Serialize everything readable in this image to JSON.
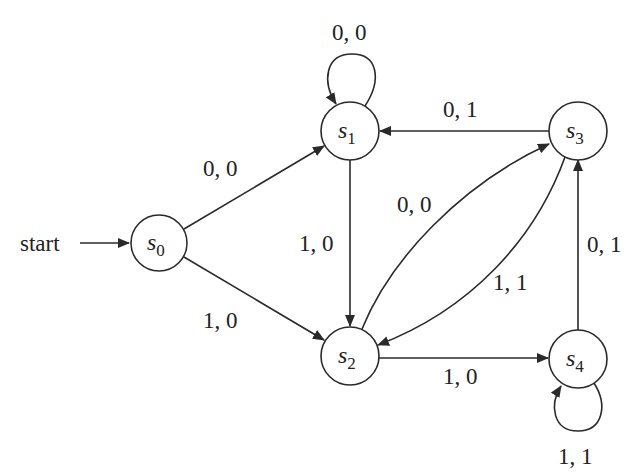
{
  "diagram": {
    "type": "finite-state-machine",
    "start_label": "start",
    "states": [
      {
        "id": "s0",
        "name": "s",
        "sub": "0"
      },
      {
        "id": "s1",
        "name": "s",
        "sub": "1"
      },
      {
        "id": "s2",
        "name": "s",
        "sub": "2"
      },
      {
        "id": "s3",
        "name": "s",
        "sub": "3"
      },
      {
        "id": "s4",
        "name": "s",
        "sub": "4"
      }
    ],
    "transitions": [
      {
        "from": "s0",
        "to": "s1",
        "label": "0, 0"
      },
      {
        "from": "s0",
        "to": "s2",
        "label": "1, 0"
      },
      {
        "from": "s1",
        "to": "s1",
        "label": "0, 0"
      },
      {
        "from": "s1",
        "to": "s2",
        "label": "1, 0"
      },
      {
        "from": "s2",
        "to": "s3",
        "label": "0, 0"
      },
      {
        "from": "s3",
        "to": "s2",
        "label": "1, 1"
      },
      {
        "from": "s3",
        "to": "s1",
        "label": "0, 1"
      },
      {
        "from": "s2",
        "to": "s4",
        "label": "1, 0"
      },
      {
        "from": "s4",
        "to": "s3",
        "label": "0, 1"
      },
      {
        "from": "s4",
        "to": "s4",
        "label": "1, 1"
      }
    ]
  }
}
